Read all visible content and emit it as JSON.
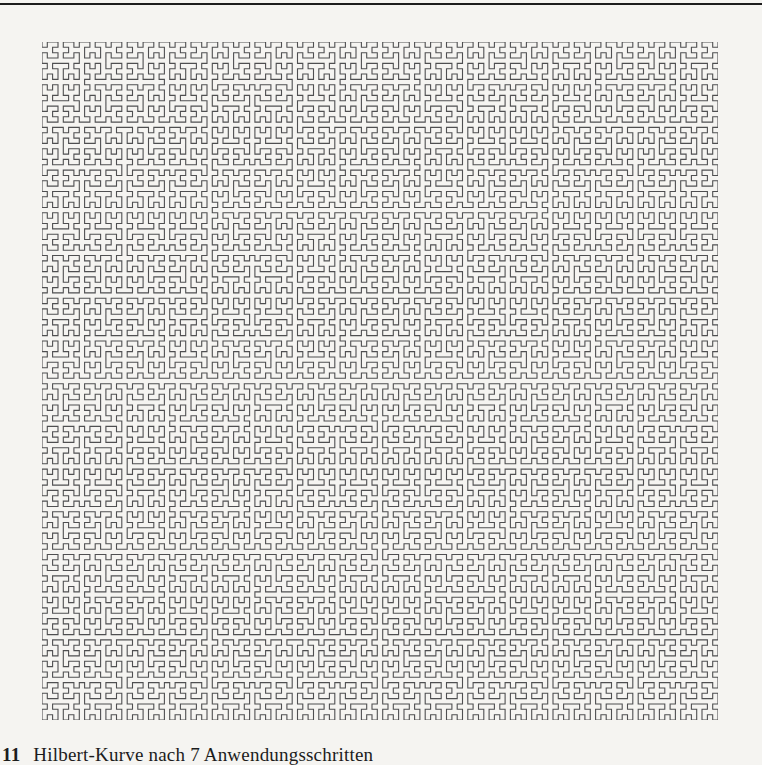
{
  "page": {
    "background": "#f5f4f1",
    "top_rule_color": "#1d1d1d"
  },
  "figure": {
    "name": "hilbert-curve",
    "order": 7,
    "steps": 7,
    "grid_points_per_side": 128,
    "stroke_color": "#4f4f51",
    "stroke_width": 1.1,
    "width": 676,
    "height": 678
  },
  "caption": {
    "number": "11",
    "text": "Hilbert-Kurve nach 7 Anwendungsschritten"
  }
}
